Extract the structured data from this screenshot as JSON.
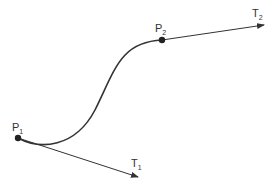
{
  "diagram": {
    "type": "hermite-curve",
    "colors": {
      "stroke": "#333333",
      "background": "#ffffff"
    },
    "points": [
      {
        "id": "P1",
        "base": "P",
        "sub": "1",
        "x": 18,
        "y": 138
      },
      {
        "id": "P2",
        "base": "P",
        "sub": "2",
        "x": 162,
        "y": 40
      }
    ],
    "tangents": [
      {
        "id": "T1",
        "base": "T",
        "sub": "1",
        "from": "P1",
        "tip": [
          138,
          177
        ]
      },
      {
        "id": "T2",
        "base": "T",
        "sub": "2",
        "from": "P2",
        "tip": [
          264,
          25
        ]
      }
    ]
  }
}
